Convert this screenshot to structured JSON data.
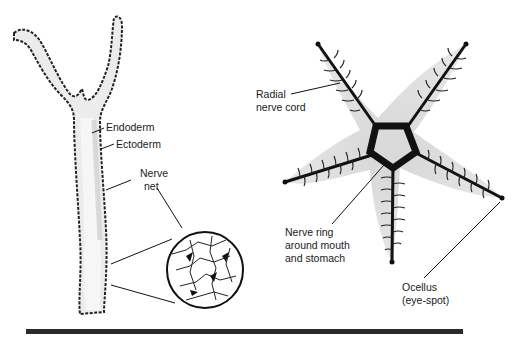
{
  "figure": {
    "left_panel": {
      "subject": "hydra",
      "labels": {
        "endoderm": "Endoderm",
        "ectoderm": "Ectoderm",
        "nerve_net_line1": "Nerve",
        "nerve_net_line2": "net"
      }
    },
    "right_panel": {
      "subject": "starfish",
      "labels": {
        "radial_line1": "Radial",
        "radial_line2": "nerve cord",
        "ring_line1": "Nerve ring",
        "ring_line2": "around mouth",
        "ring_line3": "and stomach",
        "ocellus_line1": "Ocellus",
        "ocellus_line2": "(eye-spot)"
      }
    },
    "colors": {
      "body_fill": "#e4e4e4",
      "nerve": "#111111",
      "label_text": "#1a1a1a",
      "rule": "#2b2b2b"
    }
  }
}
